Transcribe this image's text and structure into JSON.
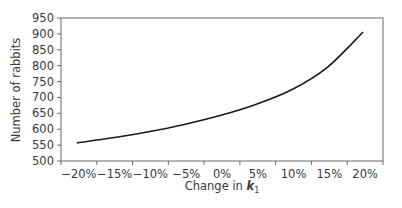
{
  "chart_data": {
    "type": "line",
    "title": "",
    "xlabel": "Change in k",
    "xlabel_subscript": "1",
    "ylabel": "Number of rabbits",
    "categories": [
      "−20%",
      "−15%",
      "−10%",
      "−5%",
      "0%",
      "5%",
      "10%",
      "15%",
      "20%"
    ],
    "series": [
      {
        "name": "Number of rabbits",
        "values": [
          557,
          573,
          592,
          615,
          643,
          678,
          724,
          795,
          906
        ],
        "color": "#1a1a1a"
      }
    ],
    "yticks": [
      500,
      550,
      600,
      650,
      700,
      750,
      800,
      850,
      900,
      950
    ],
    "ylim": [
      500,
      950
    ],
    "grid": false,
    "legend": "none"
  }
}
